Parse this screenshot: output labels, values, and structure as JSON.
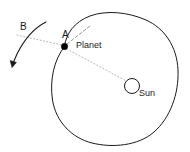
{
  "figure": {
    "type": "diagram",
    "background_color": "#ffffff",
    "stroke_color": "#1a1a1a",
    "guide_color": "#9a9a9a"
  },
  "labels": {
    "point_b": "B",
    "point_a": "A",
    "planet": "Planet",
    "sun": "Sun"
  },
  "elements": {
    "orbit": {
      "name": "orbit-path",
      "description": "closed oval orbital path"
    },
    "planet_marker": {
      "name": "planet-dot",
      "fill": "#000000",
      "radius": 3.2,
      "cx": 64.5,
      "cy": 46.5
    },
    "sun_marker": {
      "name": "sun-circle",
      "fill": "none",
      "radius": 7.5,
      "cx": 132,
      "cy": 86
    },
    "radius_line": {
      "name": "planet-sun-line",
      "style": "dotted"
    },
    "tangent_line": {
      "name": "tangent-dashed-line",
      "style": "dashed"
    },
    "chord_line": {
      "name": "guide-dotted-line",
      "style": "dotted"
    },
    "arrow_b": {
      "name": "trajectory-arrow-b",
      "style": "solid-with-arrowhead"
    }
  }
}
